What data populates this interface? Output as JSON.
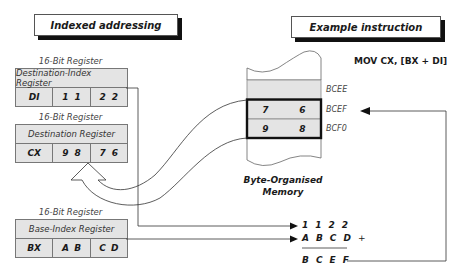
{
  "titles": {
    "left": "Indexed addressing",
    "right": "Example instruction"
  },
  "instruction": "MOV CX, [BX + DI]",
  "registers": [
    {
      "caption": "16-Bit Register",
      "name": "Destination-Index Register",
      "label": "DI",
      "high": [
        "1",
        "1"
      ],
      "low": [
        "2",
        "2"
      ]
    },
    {
      "caption": "16-Bit Register",
      "name": "Destination Register",
      "label": "CX",
      "high": [
        "9",
        "8"
      ],
      "low": [
        "7",
        "6"
      ]
    },
    {
      "caption": "16-Bit Register",
      "name": "Base-Index Register",
      "label": "BX",
      "high": [
        "A",
        "B"
      ],
      "low": [
        "C",
        "D"
      ]
    }
  ],
  "memory": {
    "caption_line1": "Byte-Organised",
    "caption_line2": "Memory",
    "rows": [
      {
        "address": "BCEE",
        "values": [
          "",
          ""
        ]
      },
      {
        "address": "BCEF",
        "values": [
          "7",
          "6"
        ]
      },
      {
        "address": "BCF0",
        "values": [
          "9",
          "8"
        ]
      }
    ]
  },
  "calculation": {
    "operand1": [
      "1",
      "1",
      "2",
      "2"
    ],
    "operand2": [
      "A",
      "B",
      "C",
      "D"
    ],
    "operator": "+",
    "result": [
      "B",
      "C",
      "E",
      "F"
    ]
  },
  "colors": {
    "cell_fill": "#e4e4e4",
    "line": "#333333",
    "shadow": "#111111"
  }
}
